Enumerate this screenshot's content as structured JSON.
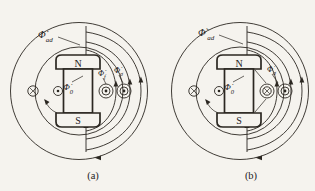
{
  "page": {
    "background": "#f5f3ee",
    "ink_color": "#2b2721"
  },
  "panels": [
    {
      "caption": "(a)",
      "pole_top": "N",
      "pole_bottom": "S",
      "flux_ad": {
        "phi": "Φ̇",
        "prime": "",
        "sub": "ad"
      },
      "flux_0": {
        "phi": "Φ̇",
        "sub": "0"
      },
      "right_flux_labels": [
        {
          "phi": "Φ̇",
          "sub": "f"
        },
        {
          "phi": "Φ̇",
          "sub": "σ"
        }
      ],
      "conductor_symbols": [
        "current-into-page-cross",
        "current-out-dot",
        "ring-conductor-dot",
        "ring-conductor-dot"
      ]
    },
    {
      "caption": "(b)",
      "pole_top": "N",
      "pole_bottom": "S",
      "flux_ad": {
        "phi": "Φ̇",
        "prime": "′",
        "sub": "ad"
      },
      "flux_0": {
        "phi": "Φ̇",
        "sub": "0"
      },
      "right_flux_labels": [
        {
          "phi": "Φ̇",
          "sub": "σ"
        }
      ],
      "conductor_symbols": [
        "current-into-page-cross",
        "current-out-dot",
        "ring-conductor-cross",
        "ring-conductor-dot"
      ]
    }
  ]
}
